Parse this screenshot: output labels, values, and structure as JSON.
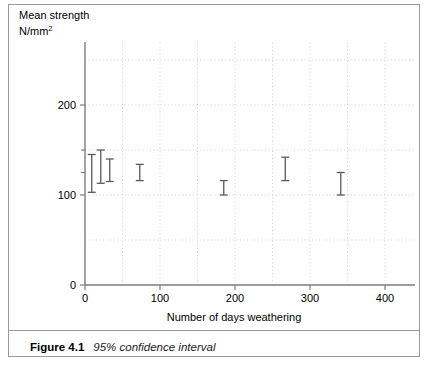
{
  "figure": {
    "caption_label": "Figure 4.1",
    "caption_text": "95% confidence interval"
  },
  "chart_data": {
    "type": "scatter",
    "title": "",
    "subtitle": "",
    "xlabel": "Number of days weathering",
    "ylabel_line1": "Mean strength",
    "ylabel_line2_base": "N/mm",
    "ylabel_line2_sup": "2",
    "ylabel_full": "Mean strength N/mm2",
    "xlim": [
      0,
      440
    ],
    "ylim": [
      0,
      270
    ],
    "x_ticks": [
      0,
      100,
      200,
      300,
      400
    ],
    "x_tick_labels": [
      "0",
      "100",
      "200",
      "300",
      "400"
    ],
    "x_minor_step": 50,
    "y_ticks": [
      0,
      100,
      200
    ],
    "y_tick_labels": [
      "0",
      "100",
      "200"
    ],
    "y_minor_step": 25,
    "grid": true,
    "grid_style": "dotted",
    "grid_color": "#c9c9c9",
    "axis_color": "#7d7d7d",
    "marker_color": "#5a5a5a",
    "legend": "none",
    "series": [
      {
        "name": "95% confidence interval",
        "error_bar_style": "capped-vertical",
        "points": [
          {
            "x": 9,
            "mean": 124,
            "low": 103,
            "high": 145
          },
          {
            "x": 21,
            "mean": 129,
            "low": 113,
            "high": 150
          },
          {
            "x": 33,
            "mean": 126,
            "low": 115,
            "high": 140
          },
          {
            "x": 73,
            "mean": 124,
            "low": 116,
            "high": 134
          },
          {
            "x": 185,
            "mean": 107,
            "low": 100,
            "high": 116
          },
          {
            "x": 267,
            "mean": 128,
            "low": 116,
            "high": 142
          },
          {
            "x": 341,
            "mean": 111,
            "low": 100,
            "high": 125
          }
        ]
      }
    ]
  }
}
